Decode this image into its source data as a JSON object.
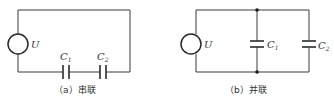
{
  "diagrams": [
    {
      "id": "a",
      "caption": "（a）串联",
      "source_label": "U",
      "capacitors": [
        {
          "label": "C",
          "subscript": "1"
        },
        {
          "label": "C",
          "subscript": "2"
        }
      ],
      "connection": "series"
    },
    {
      "id": "b",
      "caption": "（b）并联",
      "source_label": "U",
      "capacitors": [
        {
          "label": "C",
          "subscript": "1"
        },
        {
          "label": "C",
          "subscript": "2"
        }
      ],
      "connection": "parallel"
    }
  ],
  "colors": {
    "line": "#3a3a3a",
    "background": "#ffffff"
  }
}
